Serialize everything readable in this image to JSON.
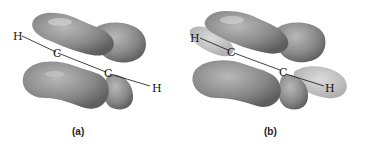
{
  "figure": {
    "panels": [
      {
        "id": "a",
        "caption": "(a)",
        "atoms": {
          "h_left": "H",
          "c_left": "C",
          "c_right": "C",
          "h_right": "H"
        },
        "lobe_color": "#8a8a8a",
        "highlight_color": "#d8d8d8"
      },
      {
        "id": "b",
        "caption": "(b)",
        "atoms": {
          "h_left": "H",
          "c_left": "C",
          "c_right": "C",
          "h_right": "H"
        },
        "lobe_color": "#8a8a8a",
        "sigma_color": "#c4c4c4",
        "highlight_color": "#d8d8d8"
      }
    ]
  }
}
